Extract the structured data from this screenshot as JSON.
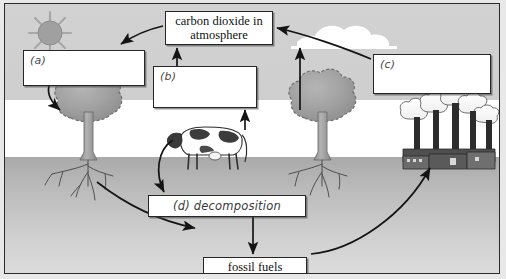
{
  "diagram": {
    "boxes": {
      "co2": {
        "text": "carbon dioxide in atmosphere"
      },
      "a": {
        "label": "(a)",
        "text": ""
      },
      "b": {
        "label": "(b)",
        "text": ""
      },
      "c": {
        "label": "(c)",
        "text": ""
      },
      "d": {
        "text": "(d) decomposition"
      },
      "fossil_fuels": {
        "text": "fossil fuels"
      }
    },
    "scene": {
      "sun": "sun-icon",
      "cloud": "cloud-icon",
      "tree_left": "tree-icon",
      "tree_right": "tree-icon",
      "cow": "cow-icon",
      "factory": "factory-icon",
      "ground_label": "soil",
      "sky_label": "sky"
    },
    "arrows": [
      {
        "name": "co2-to-plant",
        "from": "co2",
        "to": "a"
      },
      {
        "name": "plant-up-to-co2",
        "from": "b",
        "to": "co2"
      },
      {
        "name": "respiration-up-to-co2",
        "from": "tree-right",
        "to": "co2"
      },
      {
        "name": "factory-to-co2",
        "from": "c",
        "to": "co2"
      },
      {
        "name": "sun-to-plant",
        "from": "a",
        "to": "tree-left"
      },
      {
        "name": "cow-to-decomposition",
        "from": "cow",
        "to": "d"
      },
      {
        "name": "cow-up-to-co2",
        "from": "cow",
        "to": "b"
      },
      {
        "name": "decomposition-to-fossil-fuels",
        "from": "d",
        "to": "fossil-fuels"
      },
      {
        "name": "roots-to-fossil-fuels",
        "from": "tree-left-roots",
        "to": "fossil-fuels"
      },
      {
        "name": "fossil-fuels-to-factory",
        "from": "fossil-fuels",
        "to": "factory"
      }
    ],
    "colors": {
      "sky": "#cfcfcf",
      "ground": "#bcbcbc",
      "box_fill": "#ffffff",
      "stroke": "#262626",
      "foliage": "#9e9e9e",
      "smoke": "#ffffff",
      "factory": "#4a4a4a"
    }
  }
}
